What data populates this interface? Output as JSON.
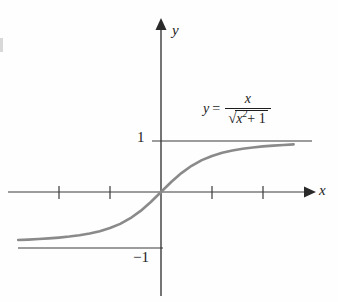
{
  "figure": {
    "kind": "math-function-graph",
    "background_color": "#fefefe",
    "axis_color": "#3a3a3a",
    "curve_color": "#8a8a8a",
    "text_color": "#1d1d1d"
  },
  "labels": {
    "y_axis_name": "y",
    "x_axis_name": "x",
    "y_tick_positive": "1",
    "y_tick_negative": "−1"
  },
  "equation": {
    "lhs": "y",
    "equals": "=",
    "numerator": "x",
    "radical_sign": "√",
    "radicand_base": "x",
    "radicand_exponent": "2",
    "radicand_tail": "+ 1",
    "plain_text": "y = x / √(x² + 1)"
  },
  "chart_data": {
    "type": "line",
    "title": "",
    "xlabel": "x",
    "ylabel": "y",
    "function": "y = x / sqrt(x^2 + 1)",
    "xlim": [
      -3.2,
      3.2
    ],
    "ylim": [
      -1.45,
      1.45
    ],
    "grid": false,
    "legend": "none",
    "annotations": [
      {
        "text": "y = x / √(x² + 1)",
        "x": 1.0,
        "y": 1.35
      }
    ],
    "asymptotes": [
      {
        "orientation": "horizontal",
        "value": 1,
        "label": "1",
        "x_from": -0.2,
        "x_to": 3.1
      },
      {
        "orientation": "horizontal",
        "value": -1,
        "label": "−1",
        "x_from": -3.0,
        "x_to": 0.05
      }
    ],
    "x_ticks": [
      -2,
      -1,
      1,
      2
    ],
    "x_tick_labels": [
      "",
      "",
      "",
      ""
    ],
    "y_ticks": [
      1,
      -1
    ],
    "y_tick_labels": [
      "1",
      "−1"
    ],
    "x": [
      -2.8,
      -2.6,
      -2.4,
      -2.2,
      -2.0,
      -1.8,
      -1.6,
      -1.4,
      -1.2,
      -1.0,
      -0.8,
      -0.6,
      -0.4,
      -0.2,
      0.0,
      0.2,
      0.4,
      0.6,
      0.8,
      1.0,
      1.2,
      1.4,
      1.6,
      1.8,
      2.0,
      2.2,
      2.4,
      2.6
    ],
    "y": [
      -0.942,
      -0.933,
      -0.923,
      -0.91,
      -0.894,
      -0.874,
      -0.848,
      -0.814,
      -0.768,
      -0.707,
      -0.625,
      -0.514,
      -0.371,
      -0.196,
      0.0,
      0.196,
      0.371,
      0.514,
      0.625,
      0.707,
      0.768,
      0.814,
      0.848,
      0.874,
      0.894,
      0.91,
      0.923,
      0.933
    ]
  },
  "geometry": {
    "origin_px": {
      "x": 161,
      "y": 192
    },
    "unit_px": 51,
    "y_unit_px": 51
  }
}
